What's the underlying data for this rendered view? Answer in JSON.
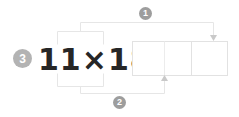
{
  "page": {
    "background_color": "#ffffff",
    "width": 239,
    "height": 117
  },
  "problem": {
    "number_label": "3",
    "badge_color": "#b3b3b3",
    "expression_text": "11×18=",
    "expression_color": "#262626",
    "factor_left": "11",
    "operator": "×",
    "factor_right": "18",
    "equals": "="
  },
  "answer_boxes": {
    "border_color": "#e2e2e2",
    "cells": [
      {
        "name": "hundreds-cell",
        "value": ""
      },
      {
        "name": "tens-cell",
        "value": ""
      },
      {
        "name": "ones-cell",
        "value": ""
      }
    ]
  },
  "steps": [
    {
      "label": "1",
      "badge_color": "#9d9d9d",
      "description": "1 × 18",
      "arrow_color": "#e6e6e6",
      "arrowhead_color": "#c9c9c9",
      "direction": "down"
    },
    {
      "label": "2",
      "badge_color": "#9d9d9d",
      "description": "1 × 18",
      "arrow_color": "#e6e6e6",
      "arrowhead_color": "#c9c9c9",
      "direction": "up"
    }
  ]
}
